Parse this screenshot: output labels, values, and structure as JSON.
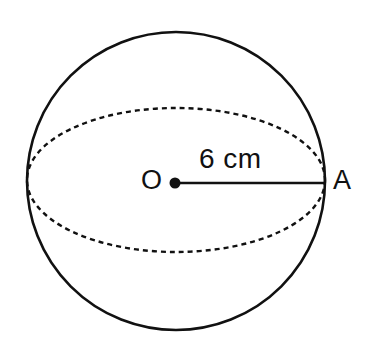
{
  "figure": {
    "type": "geometry-diagram",
    "background_color": "#ffffff",
    "stroke_color": "#111111",
    "canvas": {
      "width": 382,
      "height": 356
    },
    "sphere": {
      "outline_name": "sphere-outline-circle",
      "center_x": 176,
      "center_y": 181,
      "radius": 149,
      "stroke_width": 2.6
    },
    "equator": {
      "name": "equator-ellipse-dashed",
      "center_x": 176,
      "center_y": 180,
      "radius_x": 149,
      "radius_y": 72,
      "stroke_width": 2.4,
      "dash_pattern": "5 4"
    },
    "center_point": {
      "x": 175,
      "y": 183,
      "radius": 5.5
    },
    "radius_line": {
      "x1": 175,
      "y1": 183,
      "x2": 325,
      "y2": 183,
      "stroke_width": 2.4
    },
    "labels": {
      "center": "O",
      "point_a": "A",
      "radius_measure": "6 cm"
    }
  }
}
